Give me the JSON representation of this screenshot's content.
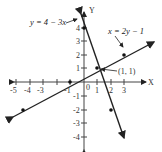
{
  "diagram": {
    "type": "coordinate-graph",
    "axes": {
      "x_label": "X",
      "y_label": "Y",
      "origin_label": "0"
    },
    "x_ticks": [
      "-5",
      "-4",
      "-3",
      "-1",
      "1",
      "2",
      "3"
    ],
    "y_ticks": [
      "4",
      "3",
      "2",
      "1",
      "-1",
      "-2",
      "-3",
      "-4"
    ],
    "lines": [
      {
        "equation": "y = 4 − 3x",
        "points": [
          [
            0,
            4
          ],
          [
            1,
            1
          ],
          [
            2,
            -2
          ]
        ]
      },
      {
        "equation": "x = 2y − 1",
        "points": [
          [
            -5,
            -2
          ],
          [
            -1,
            0
          ],
          [
            1,
            1
          ],
          [
            3,
            2
          ]
        ]
      }
    ],
    "intersection": {
      "label": "(1, 1)",
      "x": 1,
      "y": 1
    },
    "colors": {
      "line": "#222222",
      "axis": "#444444",
      "background": "#ffffff"
    }
  }
}
